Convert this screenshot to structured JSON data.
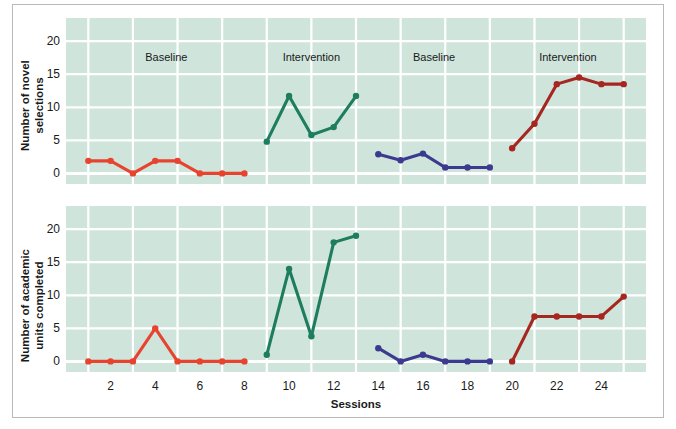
{
  "figure": {
    "background_color": "#ffffff",
    "plot_background_color": "#cfe5dc",
    "gridline_color": "#ffffff",
    "border_color": "#b9b9b9"
  },
  "axes": {
    "x_title": "Sessions",
    "x_ticks": [
      2,
      4,
      6,
      8,
      10,
      12,
      14,
      16,
      18,
      20,
      22,
      24
    ],
    "x_min": 0,
    "x_max": 26,
    "y_ticks": [
      0,
      5,
      10,
      15,
      20
    ],
    "y_min": -1.6,
    "y_max": 23.5,
    "top_y_title_line1": "Number of novel",
    "top_y_title_line2": "selections",
    "bottom_y_title_line1": "Number of academic",
    "bottom_y_title_line2": "units completed"
  },
  "phases": [
    {
      "label": "Baseline",
      "x_center": 4.5
    },
    {
      "label": "Intervention",
      "x_center": 11.0
    },
    {
      "label": "Baseline",
      "x_center": 16.5
    },
    {
      "label": "Intervention",
      "x_center": 22.5
    }
  ],
  "colors": {
    "baseline_red": "#e8432f",
    "intervention_green": "#1e7d5f",
    "baseline_blue": "#3c3a8e",
    "intervention_darkred": "#a62620"
  },
  "chart_data": [
    {
      "type": "line",
      "title": "",
      "xlabel": "Sessions",
      "ylabel": "Number of novel selections",
      "xlim": [
        0,
        26
      ],
      "ylim": [
        -1.6,
        23.5
      ],
      "grid": true,
      "legend": "none",
      "categories": [
        1,
        2,
        3,
        4,
        5,
        6,
        7,
        8,
        9,
        10,
        11,
        12,
        13,
        14,
        15,
        16,
        17,
        18,
        19,
        20,
        21,
        22,
        23,
        24,
        25
      ],
      "series": [
        {
          "name": "Baseline (phase 1)",
          "color": "#e8432f",
          "x": [
            1,
            2,
            3,
            4,
            5,
            6,
            7,
            8
          ],
          "values": [
            1.9,
            1.9,
            0.0,
            1.9,
            1.9,
            0.0,
            0.0,
            0.0
          ]
        },
        {
          "name": "Intervention (phase 2)",
          "color": "#1e7d5f",
          "x": [
            9,
            10,
            11,
            12,
            13
          ],
          "values": [
            4.8,
            11.7,
            5.8,
            7.0,
            11.7
          ]
        },
        {
          "name": "Baseline (phase 3)",
          "color": "#3c3a8e",
          "x": [
            14,
            15,
            16,
            17,
            18,
            19
          ],
          "values": [
            2.9,
            2.0,
            3.0,
            0.9,
            0.9,
            0.9
          ]
        },
        {
          "name": "Intervention (phase 4)",
          "color": "#a62620",
          "x": [
            20,
            21,
            22,
            23,
            24,
            25
          ],
          "values": [
            3.8,
            7.5,
            13.5,
            14.5,
            13.5,
            13.5
          ]
        }
      ]
    },
    {
      "type": "line",
      "title": "",
      "xlabel": "Sessions",
      "ylabel": "Number of academic units completed",
      "xlim": [
        0,
        26
      ],
      "ylim": [
        -1.6,
        23.5
      ],
      "grid": true,
      "legend": "none",
      "categories": [
        1,
        2,
        3,
        4,
        5,
        6,
        7,
        8,
        9,
        10,
        11,
        12,
        13,
        14,
        15,
        16,
        17,
        18,
        19,
        20,
        21,
        22,
        23,
        24,
        25
      ],
      "series": [
        {
          "name": "Baseline (phase 1)",
          "color": "#e8432f",
          "x": [
            1,
            2,
            3,
            4,
            5,
            6,
            7,
            8
          ],
          "values": [
            0.0,
            0.0,
            0.0,
            5.0,
            0.0,
            0.0,
            0.0,
            0.0
          ]
        },
        {
          "name": "Intervention (phase 2)",
          "color": "#1e7d5f",
          "x": [
            9,
            10,
            11,
            12,
            13
          ],
          "values": [
            1.0,
            14.0,
            3.8,
            18.0,
            19.0
          ]
        },
        {
          "name": "Baseline (phase 3)",
          "color": "#3c3a8e",
          "x": [
            14,
            15,
            16,
            17,
            18,
            19
          ],
          "values": [
            2.0,
            0.0,
            1.0,
            0.0,
            0.0,
            0.0
          ]
        },
        {
          "name": "Intervention (phase 4)",
          "color": "#a62620",
          "x": [
            20,
            21,
            22,
            23,
            24,
            25
          ],
          "values": [
            0.0,
            6.8,
            6.8,
            6.8,
            6.8,
            9.8
          ]
        }
      ]
    }
  ]
}
